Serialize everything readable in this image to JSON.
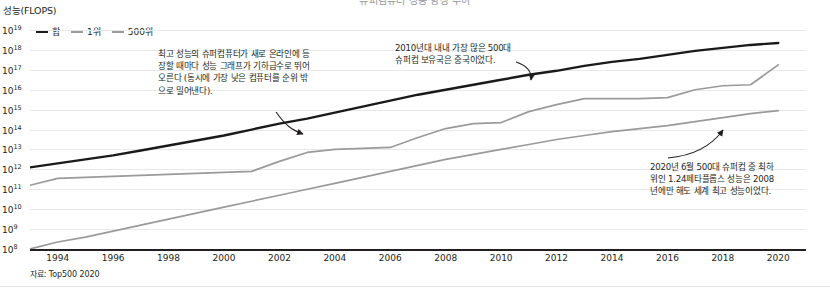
{
  "title_clipped": "슈퍼컴퓨터 성능 향상 추이",
  "axis": {
    "ylabel": "성능(FLOPS)",
    "yticks": [
      "19",
      "18",
      "17",
      "16",
      "15",
      "14",
      "13",
      "12",
      "11",
      "10",
      "9",
      "8"
    ],
    "ytick_prefix": "10",
    "xticks": [
      "1994",
      "1996",
      "1998",
      "2000",
      "2002",
      "2004",
      "2006",
      "2008",
      "2010",
      "2012",
      "2014",
      "2016",
      "2018",
      "2020"
    ]
  },
  "legend": {
    "items": [
      {
        "label": "합",
        "color": "#1a1a1a"
      },
      {
        "label": "1위",
        "color": "#9a9a9a"
      },
      {
        "label": "500위",
        "color": "#9a9a9a"
      }
    ]
  },
  "source": "자료: Top500 2020",
  "notes": [
    {
      "id": "note-1",
      "text": "최고 성능의 슈퍼컴퓨터가 새로 온라인에 등장할 때마다 성능 그래프가 기하급수로 뛰어오른다 (동시에 가장 낮은 컴퓨터를 순위 밖으로 밀어낸다)."
    },
    {
      "id": "note-2",
      "text": "2010년대 내내 가장 많은 500대 슈퍼컴 보유국은 중국이었다."
    },
    {
      "id": "note-3",
      "text": "2020년 6월 500대 슈퍼컴 중 최하위인 1.24페타플롭스 성능은 2008년에만 해도 세계 최고 성능이었다."
    }
  ],
  "chart_data": {
    "type": "line",
    "title": "슈퍼컴퓨터 성능 향상 추이",
    "xlabel": "",
    "ylabel": "성능(FLOPS)",
    "yscale": "log",
    "ylim": [
      8,
      19
    ],
    "xlim": [
      1993,
      2021
    ],
    "grid": true,
    "legend_position": "top-left",
    "x": [
      1993,
      1994,
      1995,
      1996,
      1997,
      1998,
      1999,
      2000,
      2001,
      2002,
      2003,
      2004,
      2005,
      2006,
      2007,
      2008,
      2009,
      2010,
      2011,
      2012,
      2013,
      2014,
      2015,
      2016,
      2017,
      2018,
      2019,
      2020
    ],
    "series": [
      {
        "name": "합",
        "color": "#1a1a1a",
        "unit": "log10 FLOPS",
        "values": [
          12.1,
          12.3,
          12.5,
          12.7,
          12.95,
          13.2,
          13.45,
          13.7,
          14.0,
          14.3,
          14.55,
          14.85,
          15.15,
          15.45,
          15.75,
          16.0,
          16.25,
          16.5,
          16.75,
          16.95,
          17.2,
          17.4,
          17.55,
          17.75,
          17.95,
          18.1,
          18.25,
          18.35
        ]
      },
      {
        "name": "1위",
        "color": "#9a9a9a",
        "unit": "log10 FLOPS",
        "values": [
          11.2,
          11.55,
          11.6,
          11.65,
          11.7,
          11.75,
          11.8,
          11.85,
          11.9,
          12.4,
          12.85,
          13.0,
          13.05,
          13.1,
          13.6,
          14.05,
          14.3,
          14.35,
          14.9,
          15.25,
          15.55,
          15.55,
          15.55,
          15.6,
          16.0,
          16.2,
          16.25,
          17.25
        ]
      },
      {
        "name": "500위",
        "color": "#9a9a9a",
        "unit": "log10 FLOPS",
        "values": [
          8.0,
          8.35,
          8.6,
          8.9,
          9.2,
          9.5,
          9.8,
          10.1,
          10.4,
          10.7,
          11.0,
          11.3,
          11.6,
          11.9,
          12.2,
          12.5,
          12.75,
          13.0,
          13.25,
          13.5,
          13.7,
          13.9,
          14.05,
          14.2,
          14.4,
          14.6,
          14.8,
          14.95
        ]
      }
    ],
    "annotations": [
      {
        "text": "최고 성능의 슈퍼컴퓨터가 새로 온라인에 등장할 때마다 성능 그래프가 기하급수로 뛰어오른다 (동시에 가장 낮은 컴퓨터를 순위 밖으로 밀어낸다).",
        "points_to_year": 2002,
        "points_to_series": "1위"
      },
      {
        "text": "2010년대 내내 가장 많은 500대 슈퍼컴 보유국은 중국이었다.",
        "points_to_year": 2010,
        "points_to_series": "합"
      },
      {
        "text": "2020년 6월 500대 슈퍼컴 중 최하위인 1.24페타플롭스 성능은 2008년에만 해도 세계 최고 성능이었다.",
        "points_to_year": 2019,
        "points_to_series": "500위"
      }
    ]
  }
}
